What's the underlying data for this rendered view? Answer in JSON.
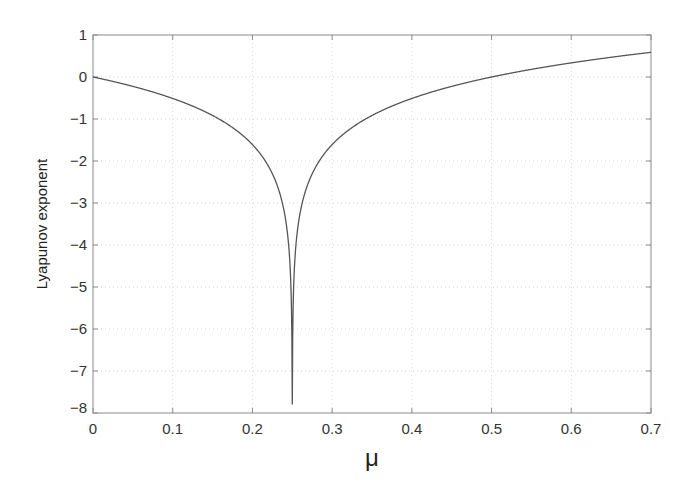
{
  "chart_data": {
    "type": "line",
    "title": "",
    "xlabel": "μ",
    "ylabel": "Lyapunov exponent",
    "xlim": [
      0,
      0.7
    ],
    "ylim": [
      -8,
      1
    ],
    "x_ticks": [
      0,
      0.1,
      0.2,
      0.3,
      0.4,
      0.5,
      0.6,
      0.7
    ],
    "x_tick_labels": [
      "0",
      "0.1",
      "0.2",
      "0.3",
      "0.4",
      "0.5",
      "0.6",
      "0.7"
    ],
    "y_ticks": [
      1,
      0,
      -1,
      -2,
      -3,
      -4,
      -5,
      -6,
      -7,
      -8
    ],
    "y_tick_labels": [
      "1",
      "0",
      "-1",
      "-2",
      "-3",
      "-4",
      "-5",
      "-6",
      "-7",
      "-8"
    ],
    "grid": true,
    "legend": null,
    "series": [
      {
        "name": "Lyapunov exponent",
        "color": "#555555",
        "x": [
          0,
          0.05,
          0.1,
          0.15,
          0.2,
          0.22,
          0.24,
          0.245,
          0.249,
          0.25,
          0.251,
          0.255,
          0.26,
          0.28,
          0.3,
          0.35,
          0.4,
          0.45,
          0.5,
          0.55,
          0.6,
          0.65,
          0.7
        ],
        "y": [
          0,
          -0.22,
          -0.51,
          -0.92,
          -1.61,
          -2.12,
          -3.22,
          -3.91,
          -5.52,
          -7.8,
          -5.52,
          -3.91,
          -3.22,
          -2.12,
          -1.61,
          -0.92,
          -0.51,
          -0.22,
          0,
          0.18,
          0.34,
          0.47,
          0.59
        ]
      }
    ]
  }
}
